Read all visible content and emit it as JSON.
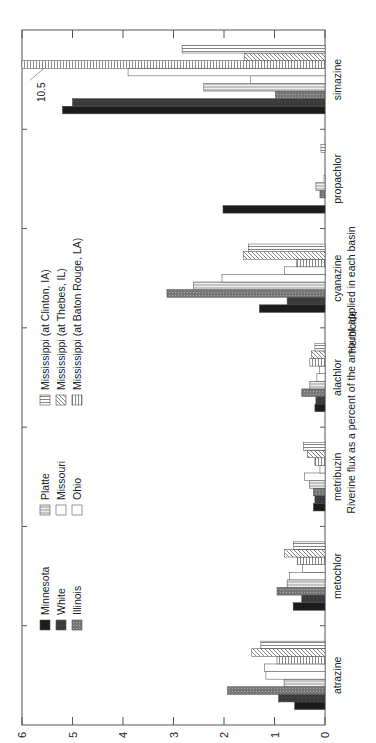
{
  "chart_data": {
    "type": "bar",
    "orientation": "rotated-90",
    "title": "",
    "xlabel": "Herbicide",
    "ylabel": "Riverine flux as a percent of the amount applied in each basin",
    "ylim": [
      0,
      6
    ],
    "yticks": [
      "0",
      "1",
      "2",
      "3",
      "4",
      "5",
      "6"
    ],
    "grid": false,
    "legend_position": "upper-left",
    "categories": [
      "atrazine",
      "metochlor",
      "metribuzin",
      "alachlor",
      "cyanazine",
      "propachlor",
      "simazine"
    ],
    "series": [
      {
        "name": "Minnesota",
        "pattern": "black",
        "values": [
          0.6,
          0.63,
          0.23,
          0.2,
          1.3,
          2.02,
          5.2
        ]
      },
      {
        "name": "White",
        "pattern": "dark-gray",
        "values": [
          0.92,
          0.46,
          0.2,
          0.18,
          0.75,
          0.0,
          5.0
        ]
      },
      {
        "name": "Illinois",
        "pattern": "gray-stipple",
        "values": [
          1.93,
          0.95,
          0.23,
          0.46,
          3.13,
          0.1,
          0.98
        ]
      },
      {
        "name": "Platte",
        "pattern": "light-gray-stipple",
        "values": [
          0.81,
          0.75,
          0.31,
          0.3,
          2.6,
          0.18,
          2.4
        ]
      },
      {
        "name": "Missouri",
        "pattern": "white",
        "values": [
          1.17,
          0.7,
          0.41,
          0.16,
          2.04,
          0.02,
          1.47
        ]
      },
      {
        "name": "Ohio",
        "pattern": "white",
        "values": [
          1.2,
          0.45,
          0.1,
          0.11,
          0.8,
          0.0,
          3.9
        ]
      },
      {
        "name": "Mississippi (at Baton Rouge, LA)",
        "pattern": "horizontal-lines",
        "values": [
          0.95,
          0.55,
          0.2,
          0.3,
          0.57,
          0.0,
          10.5
        ]
      },
      {
        "name": "Mississippi (at Thebes, IL)",
        "pattern": "diagonal-hatch",
        "values": [
          1.45,
          0.8,
          0.35,
          0.27,
          1.62,
          0.0,
          1.6
        ]
      },
      {
        "name": "Mississippi (at Clinton, IA)",
        "pattern": "vertical-lines",
        "values": [
          1.27,
          0.62,
          0.43,
          0.2,
          1.52,
          0.08,
          2.83
        ]
      }
    ],
    "annotations": [
      {
        "text": "10.5",
        "target": "simazine / Mississippi (at Baton Rouge, LA)"
      }
    ]
  },
  "legend": {
    "items": [
      {
        "label": "Minnesota"
      },
      {
        "label": "White"
      },
      {
        "label": "Illinois"
      },
      {
        "label": "Platte"
      },
      {
        "label": "Missouri"
      },
      {
        "label": "Ohio"
      },
      {
        "label": "Mississippi (at Clinton, IA)"
      },
      {
        "label": "Mississippi (at Thebes, IL)"
      },
      {
        "label": "Mississippi (at Baton Rouge, LA)"
      }
    ]
  },
  "labels": {
    "xlabel": "Herbicide",
    "ylabel": "Riverine flux as a percent of the amount applied in each basin",
    "annotation": "10.5"
  }
}
